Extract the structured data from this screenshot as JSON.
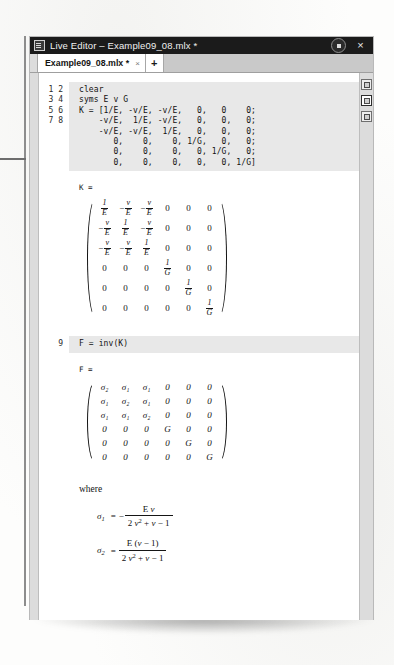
{
  "window": {
    "title": "Live Editor – Example09_08.mlx *",
    "app_icon": "live-editor-icon",
    "minimize_label": "",
    "close_label": "×"
  },
  "tabs": {
    "items": [
      {
        "label": "Example09_08.mlx *",
        "close": "×"
      }
    ],
    "add_label": "+"
  },
  "rail": {
    "buttons": [
      {
        "name": "output-inline-icon"
      },
      {
        "name": "output-right-icon"
      },
      {
        "name": "output-hidden-icon"
      }
    ]
  },
  "editor": {
    "line_numbers_a": "1\n2\n3\n4\n5\n6\n7\n8",
    "code_a": "clear\nsyms E v G\nK = [1/E, -v/E, -v/E,   0,   0    0;\n    -v/E,  1/E, -v/E,   0,   0,   0;\n    -v/E, -v/E,  1/E,   0,   0,   0;\n       0,    0,    0, 1/G,   0,   0;\n       0,    0,    0,   0, 1/G,   0;\n       0,    0,    0,   0,   0, 1/G]",
    "line_numbers_b": "9",
    "code_b": "F = inv(K)"
  },
  "outputs": {
    "k_label": "K =",
    "f_label": "F =",
    "where_label": "where"
  },
  "k_matrix": {
    "rows": [
      [
        {
          "kind": "frac",
          "neg": false,
          "num": "1",
          "den": "E"
        },
        {
          "kind": "frac",
          "neg": true,
          "num": "v",
          "den": "E"
        },
        {
          "kind": "frac",
          "neg": true,
          "num": "v",
          "den": "E"
        },
        {
          "kind": "plain",
          "text": "0"
        },
        {
          "kind": "plain",
          "text": "0"
        },
        {
          "kind": "plain",
          "text": "0"
        }
      ],
      [
        {
          "kind": "frac",
          "neg": true,
          "num": "v",
          "den": "E"
        },
        {
          "kind": "frac",
          "neg": false,
          "num": "1",
          "den": "E"
        },
        {
          "kind": "frac",
          "neg": true,
          "num": "v",
          "den": "E"
        },
        {
          "kind": "plain",
          "text": "0"
        },
        {
          "kind": "plain",
          "text": "0"
        },
        {
          "kind": "plain",
          "text": "0"
        }
      ],
      [
        {
          "kind": "frac",
          "neg": true,
          "num": "v",
          "den": "E"
        },
        {
          "kind": "frac",
          "neg": true,
          "num": "v",
          "den": "E"
        },
        {
          "kind": "frac",
          "neg": false,
          "num": "1",
          "den": "E"
        },
        {
          "kind": "plain",
          "text": "0"
        },
        {
          "kind": "plain",
          "text": "0"
        },
        {
          "kind": "plain",
          "text": "0"
        }
      ],
      [
        {
          "kind": "plain",
          "text": "0"
        },
        {
          "kind": "plain",
          "text": "0"
        },
        {
          "kind": "plain",
          "text": "0"
        },
        {
          "kind": "frac",
          "neg": false,
          "num": "1",
          "den": "G"
        },
        {
          "kind": "plain",
          "text": "0"
        },
        {
          "kind": "plain",
          "text": "0"
        }
      ],
      [
        {
          "kind": "plain",
          "text": "0"
        },
        {
          "kind": "plain",
          "text": "0"
        },
        {
          "kind": "plain",
          "text": "0"
        },
        {
          "kind": "plain",
          "text": "0"
        },
        {
          "kind": "frac",
          "neg": false,
          "num": "1",
          "den": "G"
        },
        {
          "kind": "plain",
          "text": "0"
        }
      ],
      [
        {
          "kind": "plain",
          "text": "0"
        },
        {
          "kind": "plain",
          "text": "0"
        },
        {
          "kind": "plain",
          "text": "0"
        },
        {
          "kind": "plain",
          "text": "0"
        },
        {
          "kind": "plain",
          "text": "0"
        },
        {
          "kind": "frac",
          "neg": false,
          "num": "1",
          "den": "G"
        }
      ]
    ]
  },
  "f_matrix": {
    "rows": [
      [
        "σ₂",
        "σ₁",
        "σ₁",
        "0",
        "0",
        "0"
      ],
      [
        "σ₁",
        "σ₂",
        "σ₁",
        "0",
        "0",
        "0"
      ],
      [
        "σ₁",
        "σ₁",
        "σ₂",
        "0",
        "0",
        "0"
      ],
      [
        "0",
        "0",
        "0",
        "G",
        "0",
        "0"
      ],
      [
        "0",
        "0",
        "0",
        "0",
        "G",
        "0"
      ],
      [
        "0",
        "0",
        "0",
        "0",
        "0",
        "G"
      ]
    ]
  },
  "sigma_defs": [
    {
      "symbol": "σ",
      "index": "1",
      "equals": "=",
      "leading_sign": "−",
      "numerator": "E v",
      "denominator": "2 v² + v − 1"
    },
    {
      "symbol": "σ",
      "index": "2",
      "equals": "=",
      "leading_sign": "",
      "numerator": "E (v − 1)",
      "denominator": "2 v² + v − 1"
    }
  ],
  "colors": {
    "titlebar_bg": "#1b1b1b",
    "tabstrip_bg": "#c9c9c9",
    "code_cell_bg": "#e8e8e8",
    "page_bg": "#ffffff",
    "rail_bg": "#dcdcdc"
  }
}
